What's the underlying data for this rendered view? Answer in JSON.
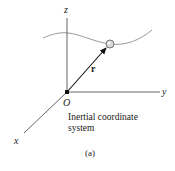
{
  "diagram": {
    "axes": {
      "z_label": "z",
      "y_label": "y",
      "x_label": "x",
      "origin_label": "O"
    },
    "vector": {
      "label": "r"
    },
    "caption": {
      "line1": "Inertial coordinate",
      "line2": "system"
    },
    "sublabel": "(a)",
    "colors": {
      "axis": "#555555",
      "vector": "#111111",
      "path": "#9a9a9a",
      "particle_fill": "#d8d8d8",
      "particle_stroke": "#777777",
      "text": "#222222"
    }
  }
}
